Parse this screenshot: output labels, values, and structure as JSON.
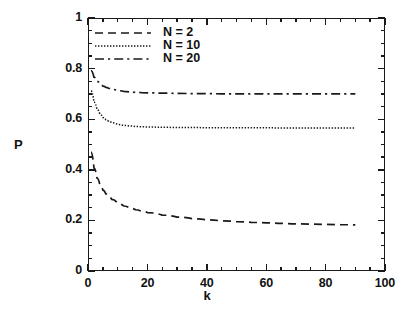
{
  "figure": {
    "background": "#ffffff",
    "ink_color": "#1a1a1a"
  },
  "axis": {
    "x_title": "k",
    "y_title": "P",
    "x_ticks": [
      "0",
      "20",
      "40",
      "60",
      "80",
      "100"
    ],
    "y_ticks": [
      "0",
      "0.2",
      "0.4",
      "0.6",
      "0.8",
      "1"
    ]
  },
  "legend": {
    "entries": [
      {
        "label": "N = 2",
        "style": "dashed"
      },
      {
        "label": "N = 10",
        "style": "dotted"
      },
      {
        "label": "N = 20",
        "style": "dashdot"
      }
    ]
  },
  "chart_data": {
    "type": "line",
    "title": "",
    "xlabel": "k",
    "ylabel": "P",
    "xlim": [
      0,
      100
    ],
    "ylim": [
      0,
      1
    ],
    "grid": false,
    "legend_position": "upper-left-inside",
    "x_major_ticks": [
      0,
      20,
      40,
      60,
      80,
      100
    ],
    "x_minor_tick_step": 5,
    "y_major_ticks": [
      0,
      0.2,
      0.4,
      0.6,
      0.8,
      1
    ],
    "y_minor_tick_step": 0.05,
    "tick_direction": "in",
    "series": [
      {
        "name": "N = 2",
        "style": "dashed",
        "asymptote": 0.18,
        "x": [
          1,
          2,
          3,
          4,
          5,
          6,
          7,
          8,
          10,
          12,
          14,
          16,
          18,
          20,
          25,
          30,
          35,
          40,
          45,
          50,
          55,
          60,
          65,
          70,
          75,
          80,
          85,
          90
        ],
        "y": [
          0.47,
          0.408,
          0.368,
          0.34,
          0.32,
          0.305,
          0.293,
          0.283,
          0.268,
          0.257,
          0.249,
          0.242,
          0.236,
          0.231,
          0.221,
          0.213,
          0.207,
          0.202,
          0.198,
          0.195,
          0.192,
          0.19,
          0.188,
          0.186,
          0.185,
          0.184,
          0.183,
          0.182
        ]
      },
      {
        "name": "N = 10",
        "style": "dotted",
        "asymptote": 0.565,
        "x": [
          1,
          2,
          3,
          4,
          5,
          6,
          7,
          8,
          10,
          12,
          14,
          16,
          18,
          20,
          25,
          30,
          35,
          40,
          45,
          50,
          55,
          60,
          65,
          70,
          75,
          80,
          85,
          90
        ],
        "y": [
          0.712,
          0.668,
          0.639,
          0.62,
          0.607,
          0.598,
          0.591,
          0.586,
          0.579,
          0.575,
          0.573,
          0.571,
          0.57,
          0.569,
          0.568,
          0.567,
          0.567,
          0.566,
          0.566,
          0.566,
          0.566,
          0.566,
          0.565,
          0.565,
          0.565,
          0.565,
          0.565,
          0.565
        ]
      },
      {
        "name": "N = 20",
        "style": "dashdot",
        "asymptote": 0.7,
        "x": [
          1,
          2,
          3,
          4,
          5,
          6,
          7,
          8,
          10,
          12,
          14,
          16,
          18,
          20,
          25,
          30,
          35,
          40,
          45,
          50,
          55,
          60,
          65,
          70,
          75,
          80,
          85,
          90
        ],
        "y": [
          0.792,
          0.766,
          0.75,
          0.739,
          0.731,
          0.726,
          0.722,
          0.718,
          0.713,
          0.71,
          0.708,
          0.706,
          0.705,
          0.704,
          0.703,
          0.702,
          0.701,
          0.701,
          0.7,
          0.7,
          0.7,
          0.7,
          0.7,
          0.7,
          0.7,
          0.7,
          0.7,
          0.7
        ]
      }
    ]
  }
}
